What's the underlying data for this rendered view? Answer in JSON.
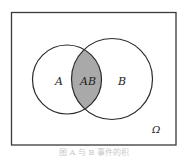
{
  "diagram": {
    "type": "venn",
    "universe_label": "Ω",
    "sets": [
      {
        "id": "A",
        "label": "A"
      },
      {
        "id": "B",
        "label": "B"
      }
    ],
    "intersection": {
      "label": "AB",
      "shaded": true
    },
    "colors": {
      "frame": "#3a3a3a",
      "outline": "#2a2a2a",
      "intersection_fill": "#a9a9a9",
      "background": "#ffffff"
    }
  },
  "caption": {
    "text": "图  A  与  B  事件的积"
  }
}
